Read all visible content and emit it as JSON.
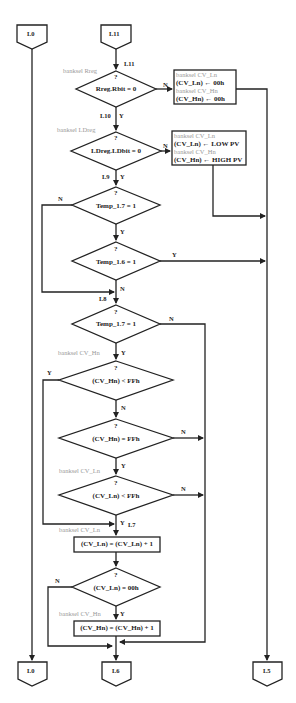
{
  "connectors_top": [
    {
      "label": "L0",
      "x": 17,
      "y": 25
    },
    {
      "label": "L11",
      "x": 100,
      "y": 25
    }
  ],
  "connectors_bottom": [
    {
      "label": "L0",
      "x": 18,
      "y": 662
    },
    {
      "label": "L6",
      "x": 102,
      "y": 662
    },
    {
      "label": "L5",
      "x": 253,
      "y": 662
    }
  ],
  "labels": {
    "l11": "L11",
    "l10": "L10",
    "l9": "L9",
    "l8": "L8",
    "l7": "L7",
    "y": "Y",
    "n": "N",
    "q": "?"
  },
  "bank_labels": {
    "rreg": "banksel Rreg",
    "ldreg": "banksel LDreg",
    "cvhn1": "banksel CV_Hn",
    "cvln1": "banksel CV_Ln",
    "cvln2": "banksel CV_Ln",
    "cvhn2": "banksel CV_Hn"
  },
  "decisions": {
    "d1": "Rreg.Rbit = 0",
    "d2": "LDreg.LDbit = 0",
    "d3": "Temp_1.7 = 1",
    "d4": "Temp_1.6 = 1",
    "d5": "Temp_1.7 = 1",
    "d6": "(CV_Hn) < FFh",
    "d7": "(CV_Hn) = FFh",
    "d8": "(CV_Ln) < FFh",
    "d9": "(CV_Ln) = 00h"
  },
  "process_boxes": {
    "box1": {
      "line1": "banksel CV_Ln",
      "line2": "(CV_Ln) ← 00h",
      "line3": "banksel CV_Hn",
      "line4": "(CV_Hn) ← 00h"
    },
    "box2": {
      "line1": "banksel CV_Ln",
      "line2": "(CV_Ln) ← LOW PV",
      "line3": "banksel CV_Hn",
      "line4": "(CV_Hn) ← HIGH PV"
    },
    "box3": "(CV_Ln) = (CV_Ln) + 1",
    "box4": "(CV_Hn) = (CV_Hn) + 1"
  },
  "colors": {
    "line": "#222222",
    "gray_text": "#999999"
  }
}
